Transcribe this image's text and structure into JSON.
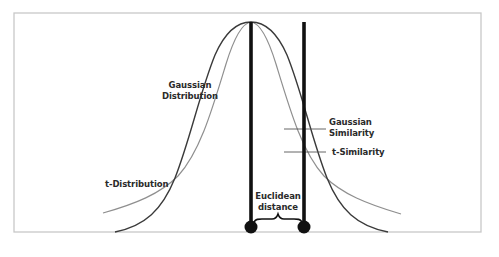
{
  "diagram": {
    "type": "distribution-comparison",
    "frame_color": "#c8c8c8",
    "colors": {
      "gaussian_curve": "#3a3a3a",
      "t_curve": "#8f8f8f",
      "distance_lines": "#111111",
      "label_text": "#2a2a2a"
    },
    "labels": {
      "gaussian_distribution_line1": "Gaussian",
      "gaussian_distribution_line2": "Distribution",
      "t_distribution": "t-Distribution",
      "gaussian_similarity_line1": "Gaussian",
      "gaussian_similarity_line2": "Similarity",
      "t_similarity": "t-Similarity",
      "euclidean_distance_line1": "Euclidean",
      "euclidean_distance_line2": "distance"
    },
    "elements": {
      "curves": [
        "Gaussian Distribution (narrower, darker)",
        "t-Distribution (heavier tails, lighter)"
      ],
      "points": [
        "reference point",
        "neighbor point"
      ],
      "similarity_markers": [
        "Gaussian Similarity",
        "t-Similarity"
      ]
    }
  }
}
